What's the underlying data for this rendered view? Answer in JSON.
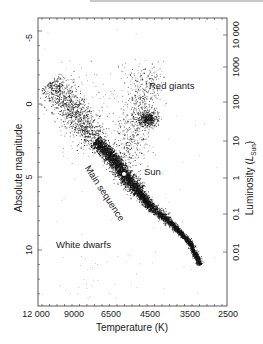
{
  "chart_data": {
    "type": "scatter",
    "title": "",
    "xlabel": "Temperature (K)",
    "ylabel_left": "Absolute magnitude",
    "ylabel_right": "Luminosity (L_Sun)",
    "ylabel_right_main": "Luminosity (",
    "ylabel_right_sym": "L",
    "ylabel_right_sub": "Sun",
    "ylabel_right_close": ")",
    "x_ticks": [
      "12 000",
      "9000",
      "6500",
      "4500",
      "3500",
      "2500"
    ],
    "x_axis_reversed": true,
    "y_left_ticks": [
      "-5",
      "0",
      "5",
      "10"
    ],
    "y_left_range": [
      -7,
      13.5
    ],
    "y_left_inverted": true,
    "y_right_ticks": [
      "10 000",
      "1000",
      "100",
      "10",
      "1",
      "0.1",
      "0.01"
    ],
    "y_right_scale": "log",
    "annotations": [
      {
        "text": "Red giants",
        "approx_temp_K": 4000,
        "approx_mag": -1.5
      },
      {
        "text": "Sun",
        "approx_temp_K": 5000,
        "approx_mag": 4.8
      },
      {
        "text": "Main sequence",
        "rotated": true
      },
      {
        "text": "White dwarfs",
        "approx_temp_K": 10000,
        "approx_mag": 10
      }
    ],
    "regions": [
      {
        "name": "main-sequence",
        "path_mag_vs_temp_K": [
          [
            11000,
            -1.5
          ],
          [
            9000,
            0.5
          ],
          [
            7500,
            2.5
          ],
          [
            6500,
            3.5
          ],
          [
            5800,
            4.8
          ],
          [
            5000,
            6
          ],
          [
            4500,
            7
          ],
          [
            4000,
            8
          ],
          [
            3500,
            9.5
          ],
          [
            3200,
            11
          ]
        ],
        "density": "high"
      },
      {
        "name": "red-giant-clump",
        "center_temp_K": 4700,
        "center_mag": 1.0,
        "density": "medium"
      },
      {
        "name": "giant-branch",
        "temp_range_K": [
          4000,
          5500
        ],
        "mag_range": [
          -3,
          4
        ],
        "density": "low"
      },
      {
        "name": "sun",
        "temp_K": 5800,
        "mag": 4.8,
        "marker": "white dot"
      }
    ],
    "grid": false,
    "legend": "none"
  },
  "labels": {
    "red_giants": "Red giants",
    "sun": "Sun",
    "main_sequence": "Main sequence",
    "white_dwarfs": "White dwarfs"
  },
  "colors": {
    "points": "#111111",
    "frame": "#333333",
    "background": "#ffffff"
  }
}
